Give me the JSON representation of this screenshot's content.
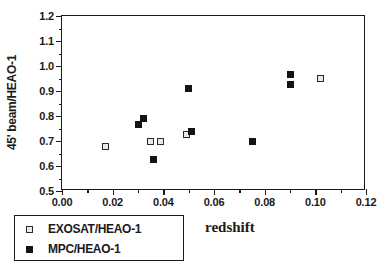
{
  "chart_data": {
    "type": "scatter",
    "title": "",
    "xlabel": "redshift",
    "ylabel": "45' beam/HEAO-1",
    "xlim": [
      0.0,
      0.12
    ],
    "ylim": [
      0.5,
      1.2
    ],
    "xticks": [
      0.0,
      0.02,
      0.04,
      0.06,
      0.08,
      0.1,
      0.12
    ],
    "xtick_labels": [
      "0.00",
      "0.02",
      "0.04",
      "0.06",
      "0.08",
      "0.10",
      "0.12"
    ],
    "yticks": [
      0.5,
      0.6,
      0.7,
      0.8,
      0.9,
      1.0,
      1.1,
      1.2
    ],
    "ytick_labels": [
      "0.5",
      "0.6",
      "0.7",
      "0.8",
      "0.9",
      "1.0",
      "1.1",
      "1.2"
    ],
    "grid": false,
    "minor_ticks": true,
    "legend_position": "below-left",
    "series": [
      {
        "name": "EXOSAT/HEAO-1",
        "marker": "open-square",
        "color": "#2b2b2b",
        "points": [
          {
            "x": 0.017,
            "y": 0.68
          },
          {
            "x": 0.035,
            "y": 0.7
          },
          {
            "x": 0.039,
            "y": 0.7
          },
          {
            "x": 0.049,
            "y": 0.725
          },
          {
            "x": 0.102,
            "y": 0.95
          }
        ]
      },
      {
        "name": "MPC/HEAO-1",
        "marker": "filled-square",
        "color": "#141414",
        "points": [
          {
            "x": 0.03,
            "y": 0.765
          },
          {
            "x": 0.032,
            "y": 0.79
          },
          {
            "x": 0.036,
            "y": 0.625
          },
          {
            "x": 0.05,
            "y": 0.91
          },
          {
            "x": 0.051,
            "y": 0.74
          },
          {
            "x": 0.075,
            "y": 0.7
          },
          {
            "x": 0.09,
            "y": 0.968
          },
          {
            "x": 0.09,
            "y": 0.925
          }
        ]
      }
    ]
  },
  "legend": {
    "entries": [
      {
        "label": "EXOSAT/HEAO-1",
        "marker": "open-square"
      },
      {
        "label": "MPC/HEAO-1",
        "marker": "filled-square"
      }
    ]
  }
}
